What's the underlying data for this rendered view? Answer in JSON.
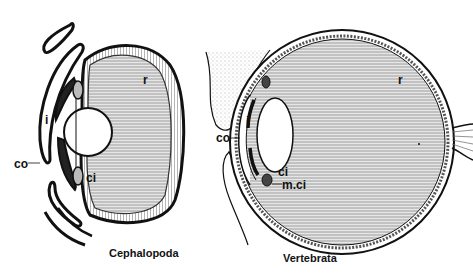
{
  "figures": [
    {
      "id": "cephalopod",
      "caption": "Cephalopoda",
      "labels": {
        "r": "r",
        "i": "i",
        "co": "co",
        "ci": "ci"
      }
    },
    {
      "id": "vertebrate",
      "caption": "Vertebrata",
      "labels": {
        "r": "r",
        "i": "i",
        "co": "co",
        "ci": "ci",
        "mci": "m.ci"
      }
    }
  ],
  "colors": {
    "ink": "#111111",
    "fill": "#d8d8d8",
    "paper": "#ffffff"
  }
}
